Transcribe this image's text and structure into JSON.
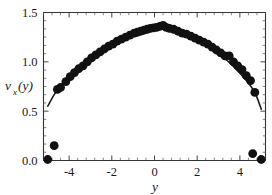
{
  "chart_data": {
    "type": "scatter",
    "title": "",
    "subtitle": "",
    "xlabel": "y",
    "ylabel": "v_x(y)",
    "ylabel_base": "v",
    "ylabel_sub": "x",
    "ylabel_arg": "(y)",
    "xlim": [
      -5.2,
      5.2
    ],
    "ylim": [
      0.0,
      1.5
    ],
    "xticks": [
      -4,
      -2,
      0,
      2,
      4
    ],
    "xticklabels": [
      "-4",
      "-2",
      "0",
      "2",
      "4"
    ],
    "yticks": [
      0.0,
      0.5,
      1.0,
      1.5
    ],
    "yticklabels": [
      "0.0",
      "0.5",
      "1.0",
      "1.5"
    ],
    "x_minor_count": 4,
    "y_minor_count": 5,
    "grid": false,
    "legend": null,
    "legend_position": "none",
    "marker": "filled-circle",
    "marker_size_px": 4.4,
    "line_color": "#111111",
    "marker_color": "#111111",
    "axis_color": "#333333",
    "background_color": "#ffffff",
    "series": [
      {
        "name": "measured velocity profile",
        "type": "scatter",
        "points": [
          [
            -5.0,
            0.01
          ],
          [
            -4.7,
            0.15
          ],
          [
            -4.55,
            0.72
          ],
          [
            -4.4,
            0.74
          ],
          [
            -4.15,
            0.8
          ],
          [
            -3.95,
            0.85
          ],
          [
            -3.75,
            0.89
          ],
          [
            -3.55,
            0.93
          ],
          [
            -3.35,
            0.96
          ],
          [
            -3.15,
            1.0
          ],
          [
            -2.95,
            1.04
          ],
          [
            -2.75,
            1.07
          ],
          [
            -2.55,
            1.1
          ],
          [
            -2.35,
            1.13
          ],
          [
            -2.15,
            1.16
          ],
          [
            -1.95,
            1.18
          ],
          [
            -1.75,
            1.21
          ],
          [
            -1.55,
            1.23
          ],
          [
            -1.35,
            1.25
          ],
          [
            -1.15,
            1.27
          ],
          [
            -0.95,
            1.29
          ],
          [
            -0.8,
            1.3
          ],
          [
            -0.65,
            1.31
          ],
          [
            -0.5,
            1.32
          ],
          [
            -0.35,
            1.33
          ],
          [
            -0.2,
            1.34
          ],
          [
            -0.05,
            1.345
          ],
          [
            0.1,
            1.35
          ],
          [
            0.25,
            1.36
          ],
          [
            0.4,
            1.37
          ],
          [
            0.55,
            1.35
          ],
          [
            0.7,
            1.34
          ],
          [
            0.9,
            1.33
          ],
          [
            1.1,
            1.31
          ],
          [
            1.3,
            1.29
          ],
          [
            1.5,
            1.28
          ],
          [
            1.7,
            1.26
          ],
          [
            1.9,
            1.24
          ],
          [
            2.1,
            1.22
          ],
          [
            2.3,
            1.2
          ],
          [
            2.5,
            1.18
          ],
          [
            2.7,
            1.15
          ],
          [
            2.9,
            1.12
          ],
          [
            3.1,
            1.09
          ],
          [
            3.3,
            1.06
          ],
          [
            3.5,
            1.06
          ],
          [
            3.7,
            1.0
          ],
          [
            3.9,
            0.96
          ],
          [
            4.1,
            0.92
          ],
          [
            4.3,
            0.86
          ],
          [
            4.5,
            0.81
          ],
          [
            4.7,
            0.69
          ],
          [
            4.6,
            0.07
          ],
          [
            5.0,
            0.01
          ]
        ]
      },
      {
        "name": "fitted profile curve",
        "type": "line",
        "points": [
          [
            -5.0,
            0.55
          ],
          [
            -4.8,
            0.63
          ],
          [
            -4.6,
            0.7
          ],
          [
            -4.4,
            0.76
          ],
          [
            -4.2,
            0.81
          ],
          [
            -4.0,
            0.855
          ],
          [
            -3.8,
            0.895
          ],
          [
            -3.6,
            0.93
          ],
          [
            -3.4,
            0.965
          ],
          [
            -3.2,
            1.0
          ],
          [
            -3.0,
            1.03
          ],
          [
            -2.8,
            1.06
          ],
          [
            -2.6,
            1.09
          ],
          [
            -2.4,
            1.12
          ],
          [
            -2.2,
            1.15
          ],
          [
            -2.0,
            1.175
          ],
          [
            -1.8,
            1.2
          ],
          [
            -1.6,
            1.22
          ],
          [
            -1.4,
            1.245
          ],
          [
            -1.2,
            1.265
          ],
          [
            -1.0,
            1.285
          ],
          [
            -0.8,
            1.3
          ],
          [
            -0.6,
            1.315
          ],
          [
            -0.4,
            1.33
          ],
          [
            -0.2,
            1.34
          ],
          [
            0.0,
            1.348
          ],
          [
            0.2,
            1.352
          ],
          [
            0.4,
            1.353
          ],
          [
            0.6,
            1.348
          ],
          [
            0.8,
            1.338
          ],
          [
            1.0,
            1.325
          ],
          [
            1.2,
            1.31
          ],
          [
            1.4,
            1.292
          ],
          [
            1.6,
            1.272
          ],
          [
            1.8,
            1.25
          ],
          [
            2.0,
            1.227
          ],
          [
            2.2,
            1.202
          ],
          [
            2.4,
            1.175
          ],
          [
            2.6,
            1.147
          ],
          [
            2.8,
            1.117
          ],
          [
            3.0,
            1.085
          ],
          [
            3.2,
            1.05
          ],
          [
            3.4,
            1.013
          ],
          [
            3.6,
            0.973
          ],
          [
            3.8,
            0.93
          ],
          [
            4.0,
            0.885
          ],
          [
            4.2,
            0.836
          ],
          [
            4.4,
            0.783
          ],
          [
            4.6,
            0.725
          ],
          [
            4.8,
            0.64
          ],
          [
            5.0,
            0.52
          ]
        ]
      }
    ]
  }
}
